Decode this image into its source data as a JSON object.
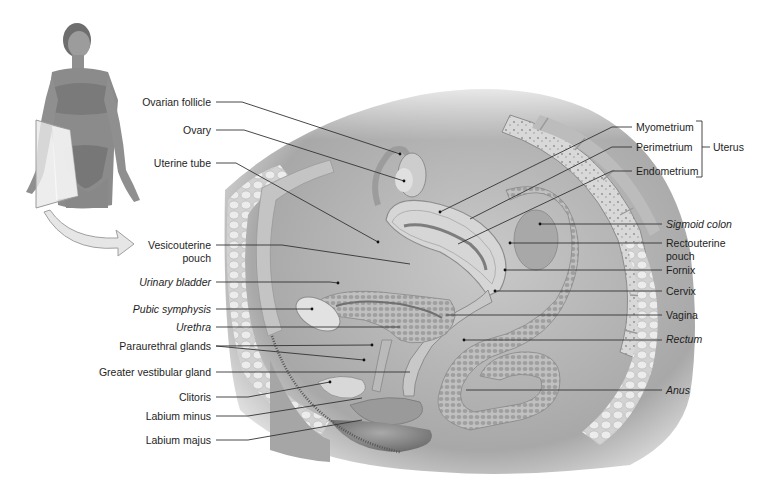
{
  "figure": {
    "inset": {
      "description": "Photo of standing female figure with sagittal sectioning plane through pelvis",
      "arrow": "curved arrow pointing to main section"
    },
    "main_illustration": "Midsagittal section of female pelvis (grayscale)",
    "labels_left": [
      {
        "text": "Ovarian follicle",
        "italic": false
      },
      {
        "text": "Ovary",
        "italic": false
      },
      {
        "text": "Uterine tube",
        "italic": false
      },
      {
        "text": "Vesicouterine",
        "line2": "pouch",
        "italic": false
      },
      {
        "text": "Urinary bladder",
        "italic": true
      },
      {
        "text": "Pubic symphysis",
        "italic": true
      },
      {
        "text": "Urethra",
        "italic": true
      },
      {
        "text": "Paraurethral glands",
        "italic": false
      },
      {
        "text": "Greater vestibular gland",
        "italic": false
      },
      {
        "text": "Clitoris",
        "italic": false
      },
      {
        "text": "Labium minus",
        "italic": false
      },
      {
        "text": "Labium majus",
        "italic": false
      }
    ],
    "labels_right": [
      {
        "text": "Myometrium",
        "italic": false
      },
      {
        "text": "Perimetrium",
        "italic": false
      },
      {
        "text": "Endometrium",
        "italic": false
      },
      {
        "text": "Sigmoid colon",
        "italic": true
      },
      {
        "text": "Rectouterine",
        "line2": "pouch",
        "italic": false
      },
      {
        "text": "Fornix",
        "italic": false
      },
      {
        "text": "Cervix",
        "italic": false
      },
      {
        "text": "Vagina",
        "italic": false
      },
      {
        "text": "Rectum",
        "italic": true
      },
      {
        "text": "Anus",
        "italic": true
      }
    ],
    "bracket_group": {
      "text": "Uterus",
      "members": [
        "Myometrium",
        "Perimetrium",
        "Endometrium"
      ]
    },
    "colors": {
      "label_text": "#1e1e1e",
      "leader_line": "#333333",
      "tissue_dark": "#8a8a8a",
      "tissue_mid": "#b8b8b8",
      "tissue_light": "#dedede",
      "background": "#ffffff"
    }
  }
}
